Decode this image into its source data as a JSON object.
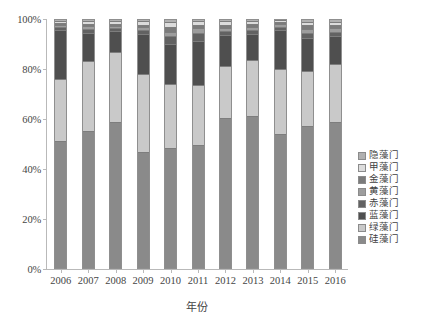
{
  "chart_data": {
    "type": "bar",
    "subtype": "100% stacked bar",
    "title": "",
    "xlabel": "年份",
    "ylabel": "",
    "ylim": [
      0,
      100
    ],
    "yticks": [
      "0%",
      "20%",
      "40%",
      "60%",
      "80%",
      "100%"
    ],
    "ytick_values": [
      0,
      20,
      40,
      60,
      80,
      100
    ],
    "grid": false,
    "legend_position": "right",
    "categories": [
      "2006",
      "2007",
      "2008",
      "2009",
      "2010",
      "2011",
      "2012",
      "2013",
      "2014",
      "2015",
      "2016"
    ],
    "series": [
      {
        "name": "硅藻门",
        "color": "#8a8a8a",
        "values": [
          51.0,
          55.0,
          58.5,
          46.5,
          48.0,
          49.0,
          60.0,
          61.0,
          53.5,
          57.0,
          58.5
        ]
      },
      {
        "name": "绿藻门",
        "color": "#c9c9c9",
        "values": [
          25.0,
          28.0,
          28.0,
          31.5,
          26.0,
          24.5,
          21.0,
          22.5,
          26.5,
          22.0,
          23.5
        ]
      },
      {
        "name": "蓝藻门",
        "color": "#4f4f4f",
        "values": [
          19.5,
          11.5,
          8.5,
          16.0,
          16.0,
          17.5,
          12.5,
          10.5,
          15.5,
          13.5,
          11.0
        ]
      },
      {
        "name": "赤藻门",
        "color": "#626262",
        "values": [
          1.2,
          1.5,
          1.3,
          1.5,
          3.0,
          3.2,
          1.6,
          1.5,
          1.3,
          2.0,
          1.8
        ]
      },
      {
        "name": "黄藻门",
        "color": "#9d9d9d",
        "values": [
          0.9,
          1.0,
          0.9,
          1.2,
          1.8,
          2.0,
          1.4,
          1.3,
          1.0,
          1.6,
          1.5
        ]
      },
      {
        "name": "金藻门",
        "color": "#7b7b7b",
        "values": [
          0.8,
          1.0,
          0.8,
          1.1,
          1.9,
          1.6,
          1.2,
          1.1,
          0.9,
          1.4,
          1.3
        ]
      },
      {
        "name": "甲藻门",
        "color": "#dcdcdc",
        "values": [
          0.9,
          1.2,
          1.1,
          1.3,
          2.0,
          1.4,
          1.4,
          1.3,
          0.8,
          1.5,
          1.4
        ]
      },
      {
        "name": "隐藻门",
        "color": "#b0b0b0",
        "values": [
          0.7,
          0.8,
          0.9,
          0.9,
          1.3,
          0.8,
          0.9,
          0.8,
          0.5,
          1.0,
          1.0
        ]
      }
    ],
    "legend_order_top_to_bottom": [
      "隐藻门",
      "甲藻门",
      "金藻门",
      "黄藻门",
      "赤藻门",
      "蓝藻门",
      "绿藻门",
      "硅藻门"
    ]
  },
  "axis": {
    "x_title": "年份"
  },
  "legend": {
    "items": [
      {
        "label": "隐藻门",
        "color": "#b0b0b0"
      },
      {
        "label": "甲藻门",
        "color": "#dcdcdc"
      },
      {
        "label": "金藻门",
        "color": "#7b7b7b"
      },
      {
        "label": "黄藻门",
        "color": "#9d9d9d"
      },
      {
        "label": "赤藻门",
        "color": "#626262"
      },
      {
        "label": "蓝藻门",
        "color": "#4f4f4f"
      },
      {
        "label": "绿藻门",
        "color": "#c9c9c9"
      },
      {
        "label": "硅藻门",
        "color": "#8a8a8a"
      }
    ]
  }
}
